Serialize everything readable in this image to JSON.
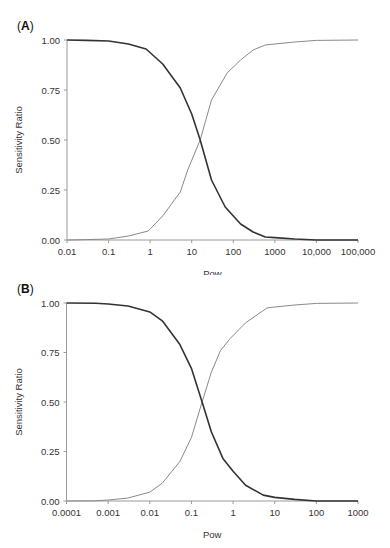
{
  "chart_data": [
    {
      "panel_label": "A",
      "type": "line",
      "title": "",
      "xlabel": "Pow",
      "ylabel": "Sensitivity Ratio",
      "xscale": "log",
      "xlim": [
        0.01,
        100000
      ],
      "ylim": [
        0,
        1
      ],
      "grid": false,
      "legend": null,
      "x_ticks": [
        0.01,
        0.1,
        1,
        10,
        100,
        1000,
        10000,
        100000
      ],
      "x_tick_labels": [
        "0.01",
        "0.1",
        "1",
        "10",
        "100",
        "1000",
        "10,000",
        "100,000"
      ],
      "y_ticks": [
        0,
        0.25,
        0.5,
        0.75,
        1
      ],
      "y_tick_labels": [
        "0.00",
        "0.25",
        "0.50",
        "0.75",
        "1.00"
      ],
      "series": [
        {
          "name": "decreasing",
          "color": "#333333",
          "width": 1.6,
          "x": [
            0.01,
            0.03,
            0.1,
            0.3,
            0.8,
            2,
            5.3,
            10,
            16,
            30,
            64,
            150,
            300,
            590,
            1000,
            3000,
            10000,
            100000
          ],
          "y": [
            1.0,
            0.998,
            0.995,
            0.98,
            0.955,
            0.88,
            0.76,
            0.63,
            0.5,
            0.3,
            0.165,
            0.08,
            0.04,
            0.015,
            0.012,
            0.005,
            0.0,
            0.0
          ]
        },
        {
          "name": "increasing",
          "color": "#8a8a8a",
          "width": 1.0,
          "x": [
            0.01,
            0.03,
            0.1,
            0.3,
            0.9,
            2,
            5.3,
            8,
            16,
            30,
            71,
            150,
            300,
            590,
            1000,
            3000,
            10000,
            100000
          ],
          "y": [
            0.0,
            0.002,
            0.005,
            0.02,
            0.045,
            0.12,
            0.24,
            0.35,
            0.5,
            0.7,
            0.835,
            0.9,
            0.95,
            0.975,
            0.98,
            0.99,
            0.998,
            1.0
          ]
        }
      ]
    },
    {
      "panel_label": "B",
      "type": "line",
      "title": "",
      "xlabel": "Pow",
      "ylabel": "Sensitivity Ratio",
      "xscale": "log",
      "xlim": [
        0.0001,
        1000
      ],
      "ylim": [
        0,
        1
      ],
      "grid": false,
      "legend": null,
      "x_ticks": [
        0.0001,
        0.001,
        0.01,
        0.1,
        1,
        10,
        100,
        1000
      ],
      "x_tick_labels": [
        "0.0001",
        "0.001",
        "0.01",
        "0.1",
        "1",
        "10",
        "100",
        "1000"
      ],
      "y_ticks": [
        0,
        0.25,
        0.5,
        0.75,
        1
      ],
      "y_tick_labels": [
        "0.00",
        "0.25",
        "0.50",
        "0.75",
        "1.00"
      ],
      "series": [
        {
          "name": "decreasing",
          "color": "#333333",
          "width": 1.6,
          "x": [
            0.0001,
            0.0005,
            0.001,
            0.003,
            0.01,
            0.02,
            0.053,
            0.1,
            0.18,
            0.3,
            0.57,
            1,
            2,
            5.3,
            10,
            30,
            100,
            1000
          ],
          "y": [
            1.0,
            0.999,
            0.995,
            0.985,
            0.955,
            0.91,
            0.79,
            0.67,
            0.5,
            0.35,
            0.215,
            0.15,
            0.08,
            0.03,
            0.018,
            0.008,
            0.0,
            0.0
          ]
        },
        {
          "name": "increasing",
          "color": "#8a8a8a",
          "width": 1.0,
          "x": [
            0.0001,
            0.0005,
            0.001,
            0.003,
            0.01,
            0.02,
            0.053,
            0.1,
            0.18,
            0.3,
            0.5,
            0.85,
            2,
            6.5,
            10,
            30,
            100,
            1000
          ],
          "y": [
            0.0,
            0.001,
            0.005,
            0.015,
            0.045,
            0.09,
            0.2,
            0.32,
            0.5,
            0.65,
            0.76,
            0.82,
            0.9,
            0.975,
            0.98,
            0.99,
            0.998,
            1.0
          ]
        }
      ]
    }
  ]
}
